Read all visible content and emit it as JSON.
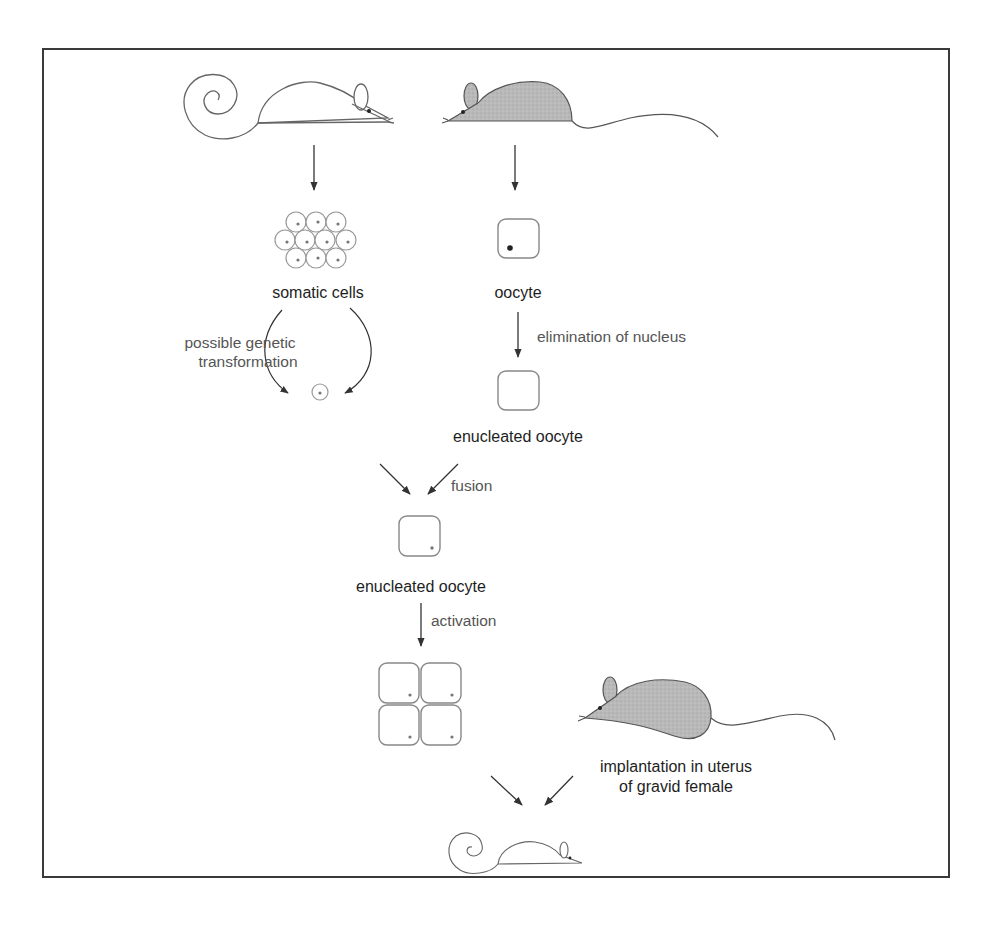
{
  "figure": {
    "labels": {
      "somatic_cells": "somatic cells",
      "oocyte": "oocyte",
      "genetic_transformation_line1": "possible genetic",
      "genetic_transformation_line2": "transformation",
      "elimination": "elimination of nucleus",
      "enucleated_oocyte_1": "enucleated oocyte",
      "fusion": "fusion",
      "enucleated_oocyte_2": "enucleated oocyte",
      "activation": "activation",
      "implantation_line1": "implantation in uterus",
      "implantation_line2": "of gravid female"
    },
    "nodes": [
      {
        "id": "donor-mouse",
        "desc": "white mouse with curled tail (donor)"
      },
      {
        "id": "oocyte-donor-mouse",
        "desc": "gray mouse (oocyte donor)"
      },
      {
        "id": "somatic-cells",
        "desc": "cluster of 10 cells"
      },
      {
        "id": "single-somatic-cell",
        "desc": "single cell"
      },
      {
        "id": "oocyte",
        "desc": "oocyte with nucleus"
      },
      {
        "id": "enucleated-oocyte",
        "desc": "oocyte without nucleus"
      },
      {
        "id": "fused-oocyte",
        "desc": "enucleated oocyte with donor nucleus"
      },
      {
        "id": "four-cell-embryo",
        "desc": "4-cell embryo"
      },
      {
        "id": "surrogate-mother",
        "desc": "gray pregnant mouse"
      },
      {
        "id": "cloned-mouse",
        "desc": "white cloned mouse with curled tail"
      }
    ],
    "colors": {
      "frame": "#3a3a3a",
      "stroke": "#555555",
      "mouse_fill_gray": "#b8b8b8",
      "arrow": "#333333"
    }
  }
}
